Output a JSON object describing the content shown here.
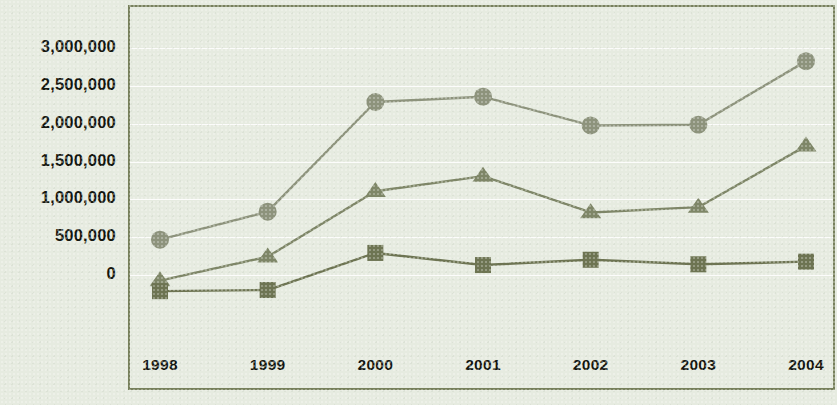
{
  "chart_data": {
    "type": "line",
    "title": "",
    "subtitle": "",
    "xlabel": "",
    "ylabel": "",
    "categories": [
      "1998",
      "1999",
      "2000",
      "2001",
      "2002",
      "2003",
      "2004"
    ],
    "x": [
      1998,
      1999,
      2000,
      2001,
      2002,
      2003,
      2004
    ],
    "ylim": [
      -500000,
      3000000
    ],
    "ytick_values": [
      3000000,
      2500000,
      2000000,
      1500000,
      1000000,
      500000,
      0
    ],
    "ytick_labels": [
      "3,000,000",
      "2,500,000",
      "2,000,000",
      "1,500,000",
      "1,000,000",
      "500,000",
      "0"
    ],
    "grid": true,
    "grid_axis": "y",
    "legend_position": "none",
    "series": [
      {
        "name": "series-circle",
        "marker": "circle",
        "color": "#8d937c",
        "line_color": "#8d937c",
        "values": [
          440000,
          810000,
          2260000,
          2330000,
          1950000,
          1960000,
          2800000
        ]
      },
      {
        "name": "series-triangle",
        "marker": "triangle",
        "color": "#7e8667",
        "line_color": "#7e8667",
        "values": [
          -100000,
          215000,
          1080000,
          1280000,
          800000,
          870000,
          1680000
        ]
      },
      {
        "name": "series-square",
        "marker": "square",
        "color": "#6d7452",
        "line_color": "#6d7452",
        "values": [
          -240000,
          -225000,
          265000,
          105000,
          175000,
          115000,
          150000
        ]
      }
    ]
  },
  "style": {
    "background_color": "#e6ebe0",
    "plot_background_color": "#e6ebe0",
    "border_color": "#77805c",
    "gridline_color": "#ffffff",
    "tick_label_color": "#14160f"
  }
}
